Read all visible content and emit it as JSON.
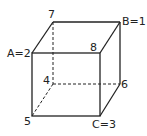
{
  "diagram": {
    "type": "cube",
    "labels": {
      "top_back_left": "7",
      "top_back_right": "B=1",
      "top_front_left": "A=2",
      "top_front_right": "8",
      "bottom_back_left": "4",
      "bottom_back_right": "6",
      "bottom_front_left": "5",
      "bottom_front_right": "C=3"
    },
    "colors": {
      "line": "#222222",
      "background": "#ffffff"
    }
  }
}
